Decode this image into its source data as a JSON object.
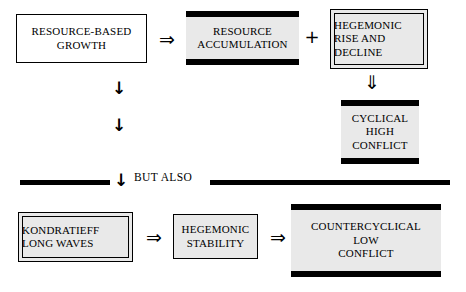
{
  "diagram": {
    "colors": {
      "ink": "#000000",
      "box_fill_grey": "#e9e9e9",
      "box_fill_white": "#ffffff",
      "background": "#ffffff"
    },
    "boxes": [
      {
        "id": "resource-based-growth",
        "style": "plain",
        "align": "center",
        "lines": [
          "Resource-Based",
          "Growth"
        ]
      },
      {
        "id": "resource-accumulation",
        "style": "bars",
        "align": "center",
        "lines": [
          "Resource",
          "Accumulation"
        ]
      },
      {
        "id": "hegemonic-rise-and-decline",
        "style": "double",
        "align": "left",
        "lines": [
          "Hegemonic",
          "Rise and",
          "Decline"
        ]
      },
      {
        "id": "cyclical-high-conflict",
        "style": "bars",
        "align": "center",
        "lines": [
          "Cyclical",
          "High",
          "Conflict"
        ]
      },
      {
        "id": "kondratieff-long-waves",
        "style": "double",
        "align": "left",
        "lines": [
          "Kondratieff",
          "Long Waves"
        ]
      },
      {
        "id": "hegemonic-stability",
        "style": "thin-grey",
        "align": "center",
        "lines": [
          "Hegemonic",
          "Stability"
        ]
      },
      {
        "id": "countercyclical-low-conflict",
        "style": "bars",
        "align": "center",
        "lines": [
          "Countercyclical",
          "Low",
          "Conflict"
        ]
      }
    ],
    "connectors": {
      "growth_to_accumulation": "⇒",
      "accumulation_plus_hegemonic": "+",
      "hegemonic_to_cyclical": "⇓",
      "growth_down_1": "↓",
      "growth_down_2": "↓",
      "divider_arrow": "↓",
      "kondratieff_to_stability": "⇒",
      "stability_to_countercyclical": "⇒"
    },
    "divider": {
      "label": "But Also"
    }
  }
}
